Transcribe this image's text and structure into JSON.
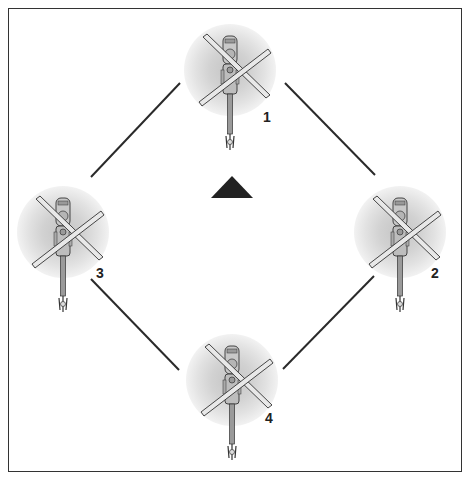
{
  "diagram": {
    "type": "formation",
    "formation_name": "diamond",
    "frame": {
      "x": 8,
      "y": 8,
      "width": 454,
      "height": 464,
      "border_color": "#333333"
    },
    "reference_marker": {
      "shape": "triangle-up",
      "center_x": 232,
      "center_y": 187,
      "color": "#222222"
    },
    "aircraft": [
      {
        "id": "1",
        "label": "1",
        "nose_x": 230,
        "nose_y": 36,
        "label_x": 263,
        "label_y": 110
      },
      {
        "id": "2",
        "label": "2",
        "nose_x": 400,
        "nose_y": 198,
        "label_x": 431,
        "label_y": 266
      },
      {
        "id": "3",
        "label": "3",
        "nose_x": 63,
        "nose_y": 198,
        "label_x": 96,
        "label_y": 266
      },
      {
        "id": "4",
        "label": "4",
        "nose_x": 232,
        "nose_y": 346,
        "label_x": 265,
        "label_y": 411
      }
    ],
    "connectors": [
      {
        "from": "3",
        "to": "1",
        "x1": 91,
        "y1": 177,
        "x2": 180,
        "y2": 83
      },
      {
        "from": "1",
        "to": "2",
        "x1": 285,
        "y1": 83,
        "x2": 375,
        "y2": 175
      },
      {
        "from": "3",
        "to": "4",
        "x1": 91,
        "y1": 279,
        "x2": 179,
        "y2": 370
      },
      {
        "from": "4",
        "to": "2",
        "x1": 283,
        "y1": 369,
        "x2": 374,
        "y2": 276
      }
    ],
    "colors": {
      "line": "#2a2a2a",
      "rotor_disc_outer": "#ececec",
      "rotor_disc_mid": "#dddddd",
      "rotor_disc_inner": "#cfcfcf",
      "fuselage": "#bdbdbd",
      "outline": "#333333",
      "blade": "#e6e6e6"
    },
    "labels": {
      "aircraft_1": "1",
      "aircraft_2": "2",
      "aircraft_3": "3",
      "aircraft_4": "4"
    }
  }
}
